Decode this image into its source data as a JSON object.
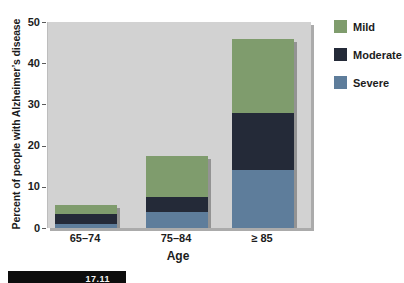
{
  "figure_label": "17.11",
  "chart_data": {
    "type": "bar",
    "stacked": true,
    "title": "",
    "xlabel": "Age",
    "ylabel": "Percent of people with Alzheimer’s disease",
    "categories": [
      "65–74",
      "75–84",
      "≥ 85"
    ],
    "series": [
      {
        "name": "Severe",
        "color": "#5e7d9b",
        "shadow": "#43576c",
        "values": [
          1,
          4,
          14
        ]
      },
      {
        "name": "Moderate",
        "color": "#242a38",
        "shadow": "#15181f",
        "values": [
          2.5,
          3.5,
          14
        ]
      },
      {
        "name": "Mild",
        "color": "#7f9c6d",
        "shadow": "#5c7050",
        "values": [
          2,
          10,
          18
        ]
      }
    ],
    "stack_order_bottom_to_top": [
      "Severe",
      "Moderate",
      "Mild"
    ],
    "stack_totals": [
      5.5,
      17.5,
      46
    ],
    "ylim": [
      0,
      50
    ],
    "yticks": [
      0,
      10,
      20,
      30,
      40,
      50
    ],
    "grid": false,
    "plot_background": "#d2d2d2",
    "legend": {
      "position": "top-right",
      "entries": [
        "Mild",
        "Moderate",
        "Severe"
      ]
    }
  }
}
